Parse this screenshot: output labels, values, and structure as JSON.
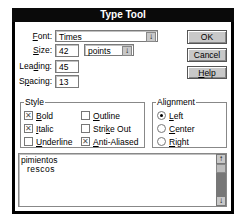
{
  "window": {
    "title": "Type Tool"
  },
  "fields": {
    "font": {
      "label": "Font:",
      "value": "Times"
    },
    "size": {
      "label": "Size:",
      "value": "42",
      "unit": "points"
    },
    "leading": {
      "label": "Leading:",
      "value": "45"
    },
    "spacing": {
      "label": "Spacing:",
      "value": "13"
    }
  },
  "buttons": {
    "ok": "OK",
    "cancel": "Cancel",
    "help": "Help"
  },
  "style": {
    "title": "Style",
    "options": [
      {
        "label": "Bold",
        "checked": true
      },
      {
        "label": "Italic",
        "checked": true
      },
      {
        "label": "Underline",
        "checked": false
      },
      {
        "label": "Outline",
        "checked": false
      },
      {
        "label": "Strike Out",
        "checked": false
      },
      {
        "label": "Anti-Aliased",
        "checked": true
      }
    ]
  },
  "alignment": {
    "title": "Alignment",
    "options": [
      {
        "label": "Left",
        "selected": true
      },
      {
        "label": "Center",
        "selected": false
      },
      {
        "label": "Right",
        "selected": false
      }
    ]
  },
  "text": {
    "line1": "pimientos",
    "line2": "rescos"
  },
  "icons": {
    "dropdown": "↓",
    "check": "✕",
    "scroll_up": "↑",
    "scroll_down": "↓"
  }
}
